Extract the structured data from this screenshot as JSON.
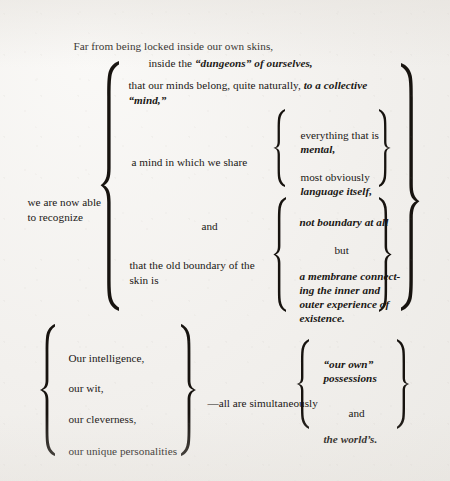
{
  "document": {
    "type": "scanned-book-page-diagram",
    "title": "Far from being locked inside our own skins",
    "background_color": "#f2f0ed",
    "ink_color": "#17130f"
  },
  "intro": {
    "line1": "Far from being locked inside our own skins,",
    "line2_roman": "inside the ",
    "line2_italic": "“dungeons” of ourselves,"
  },
  "stem": {
    "line1": "we are now able",
    "line2": "to recognize"
  },
  "branch_a": {
    "line1_roman": "that our minds belong, quite naturally, ",
    "line1_italic": "to a collective",
    "line2_italic": "“mind,”"
  },
  "branch_b": {
    "lead": "a mind in which we share",
    "items": [
      {
        "roman": "everything that is",
        "italic": "mental,"
      },
      {
        "roman": "most obviously",
        "italic": "language itself,"
      }
    ]
  },
  "conjunction": "and",
  "branch_c": {
    "lead_line1": "that the old boundary of the",
    "lead_line2": "skin is",
    "items": [
      {
        "italic": "not boundary at all"
      },
      {
        "roman": "but"
      },
      {
        "italic_lines": [
          "a membrane connect-",
          "ing the inner and",
          "outer experience of",
          "existence."
        ]
      }
    ]
  },
  "coda": {
    "left_items": [
      "Our intelligence,",
      "our wit,",
      "our cleverness,",
      "our unique personalities"
    ],
    "connector": "—all are simultaneously",
    "right_items": [
      {
        "italic_lines": [
          "“our own”",
          "possessions"
        ]
      },
      {
        "roman": "and"
      },
      {
        "italic_lines": [
          "the world’s."
        ]
      }
    ]
  }
}
